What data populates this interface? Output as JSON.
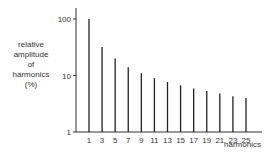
{
  "chart_data": {
    "type": "bar",
    "title": "",
    "xlabel": "harmonics",
    "ylabel": "relative amplitude of harmonics (%)",
    "ylabel_lines": [
      "relative",
      "amplitude",
      "of",
      "harmonics",
      "(%)"
    ],
    "yscale": "log",
    "ylim": [
      1,
      100
    ],
    "yticks": [
      "1",
      "10",
      "100"
    ],
    "categories": [
      "1",
      "3",
      "5",
      "7",
      "9",
      "11",
      "13",
      "15",
      "17",
      "19",
      "21",
      "23",
      "25"
    ],
    "values": [
      100,
      32,
      20,
      14,
      11,
      9,
      7.7,
      6.7,
      5.9,
      5.3,
      4.8,
      4.3,
      4.0
    ],
    "grid": false,
    "legend": null
  }
}
